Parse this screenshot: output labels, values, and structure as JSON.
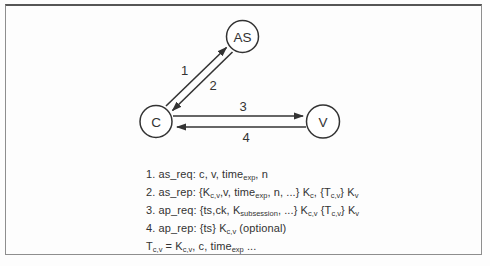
{
  "diagram": {
    "nodes": [
      {
        "id": "AS",
        "label": "AS"
      },
      {
        "id": "C",
        "label": "C"
      },
      {
        "id": "V",
        "label": "V"
      }
    ],
    "edges": [
      {
        "label": "1",
        "from": "C",
        "to": "AS"
      },
      {
        "label": "2",
        "from": "AS",
        "to": "C"
      },
      {
        "label": "3",
        "from": "C",
        "to": "V"
      },
      {
        "label": "4",
        "from": "V",
        "to": "C"
      }
    ]
  },
  "legend": {
    "lines": [
      {
        "segments": [
          {
            "text": "1. as_req: c, v, time"
          },
          {
            "text": "exp",
            "sub": true
          },
          {
            "text": ", n"
          }
        ]
      },
      {
        "segments": [
          {
            "text": "2. as_rep: {K"
          },
          {
            "text": "c,v",
            "sub": true
          },
          {
            "text": ",v, time"
          },
          {
            "text": "exp",
            "sub": true
          },
          {
            "text": ", n, ...} K"
          },
          {
            "text": "c",
            "sub": true
          },
          {
            "text": ", {T"
          },
          {
            "text": "c,v",
            "sub": true
          },
          {
            "text": "} K"
          },
          {
            "text": "v",
            "sub": true
          }
        ]
      },
      {
        "segments": [
          {
            "text": "3. ap_req: {ts,ck, K"
          },
          {
            "text": "subsession",
            "sub": true
          },
          {
            "text": ", ...} K"
          },
          {
            "text": "c,v",
            "sub": true
          },
          {
            "text": " {T"
          },
          {
            "text": "c,v",
            "sub": true
          },
          {
            "text": "} K"
          },
          {
            "text": "v",
            "sub": true
          }
        ]
      },
      {
        "segments": [
          {
            "text": "4. ap_rep: {ts} K"
          },
          {
            "text": "c,v",
            "sub": true
          },
          {
            "text": " (optional)"
          }
        ]
      },
      {
        "segments": [
          {
            "text": "T"
          },
          {
            "text": "c,v",
            "sub": true
          },
          {
            "text": " = K"
          },
          {
            "text": "c,v",
            "sub": true
          },
          {
            "text": ", c, time"
          },
          {
            "text": "exp",
            "sub": true
          },
          {
            "text": " ..."
          }
        ]
      }
    ]
  },
  "colors": {
    "ink": "#333333",
    "frame_border": "#8e8e8e",
    "frame_top": "#565656",
    "background": "#fdfdfd"
  }
}
